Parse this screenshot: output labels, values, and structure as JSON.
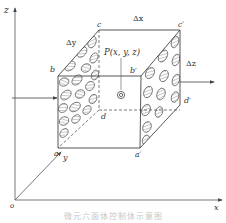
{
  "figure": {
    "axes": {
      "z_label": "z",
      "x_label": "x",
      "y_label": "y",
      "origin_label": "o"
    },
    "vertices": {
      "a": "a",
      "a_prime": "a′",
      "b": "b",
      "b_prime": "b′",
      "c": "c",
      "c_prime": "c′",
      "d": "d",
      "d_prime": "d′"
    },
    "dimensions": {
      "dx": "Δx",
      "dy": "Δy",
      "dz": "Δz"
    },
    "point_label": "P(x, y, z)",
    "point_icon": "bullseye-icon",
    "flow_arrows": [
      "inflow-arrow-left",
      "outflow-arrow-right"
    ],
    "colors": {
      "line": "#444444",
      "hatch": "#666666",
      "caption": "#c8c8c8"
    }
  },
  "caption": "微元六面体控制体示意图"
}
